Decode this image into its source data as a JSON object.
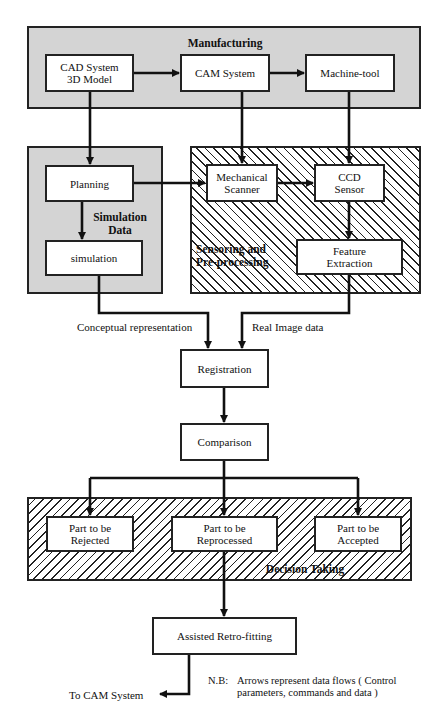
{
  "diagram": {
    "groups": {
      "manufacturing": {
        "title": "Manufacturing"
      },
      "simulation_data": {
        "title": "Simulation Data"
      },
      "sensoring": {
        "title": "Sensoring and Pre-processing"
      },
      "decision": {
        "title": "Decision Taking"
      }
    },
    "nodes": {
      "cad": {
        "line1": "CAD  System",
        "line2": "3D Model"
      },
      "cam": {
        "label": "CAM System"
      },
      "machine": {
        "label": "Machine-tool"
      },
      "planning": {
        "label": "Planning"
      },
      "simulation": {
        "label": "simulation"
      },
      "mech_scanner": {
        "line1": "Mechanical",
        "line2": "Scanner"
      },
      "ccd": {
        "line1": "CCD",
        "line2": "Sensor"
      },
      "feature": {
        "line1": "Feature",
        "line2": "Extraction"
      },
      "registration": {
        "label": "Registration"
      },
      "comparison": {
        "label": "Comparison"
      },
      "rejected": {
        "line1": "Part  to be",
        "line2": "Rejected"
      },
      "reprocessed": {
        "line1": "Part   to  be",
        "line2": "Reprocessed"
      },
      "accepted": {
        "line1": "Part to be",
        "line2": "Accepted"
      },
      "retrofitting": {
        "label": "Assisted Retro-fitting"
      }
    },
    "edge_labels": {
      "conceptual": "Conceptual representation",
      "real_image": "Real Image data",
      "to_cam": "To CAM System"
    },
    "note": {
      "prefix": "N.B:",
      "line1": "Arrows represent data flows ( Control",
      "line2": "parameters,  commands   and   data )"
    },
    "colors": {
      "line": "#222222",
      "stipple_fill": "#d4d4d4",
      "box_fill": "#ffffff"
    }
  }
}
